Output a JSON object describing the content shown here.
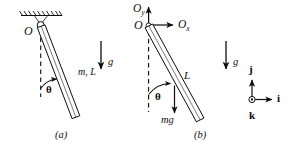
{
  "figure": {
    "type": "physics-free-body-diagram",
    "ink_color": "#0d0d0d",
    "background_color": "#ffffff"
  },
  "panel_a": {
    "caption": "(a)",
    "pivot_label": "O",
    "rod_label": "m, L",
    "angle_label": "θ",
    "gravity_label": "g",
    "support": "hatched-ceiling",
    "rod_angle_from_vertical_deg": 22
  },
  "panel_b": {
    "caption": "(b)",
    "origin_label": "O",
    "reaction_vertical_label": "O",
    "reaction_vertical_sub": "y",
    "reaction_horizontal_label": "O",
    "reaction_horizontal_sub": "x",
    "rod_length_label": "L",
    "angle_label": "θ",
    "weight_label": "mg",
    "gravity_label": "g",
    "rod_angle_from_vertical_deg": 28
  },
  "basis_triad": {
    "up_label": "j",
    "right_label": "i",
    "out_of_page_label": "k",
    "out_of_page_symbol": "dot-in-circle"
  }
}
